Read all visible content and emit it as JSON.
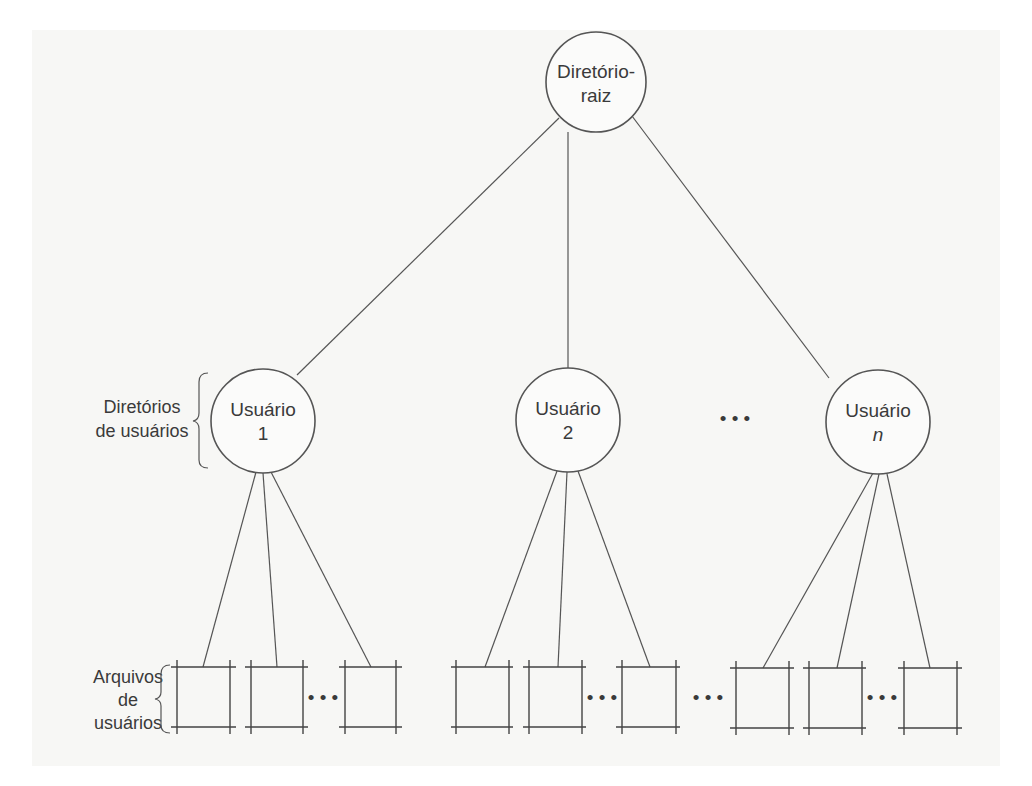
{
  "diagram": {
    "type": "tree",
    "root": {
      "line1": "Diretório-",
      "line2": "raiz"
    },
    "users": [
      {
        "line1": "Usuário",
        "line2": "1",
        "italic": false
      },
      {
        "line1": "Usuário",
        "line2": "2",
        "italic": false
      },
      {
        "line1": "Usuário",
        "line2": "n",
        "italic": true
      }
    ],
    "user_ellipsis": "• • •",
    "file_ellipsis": "• • •",
    "labels": {
      "user_dirs": {
        "line1": "Diretórios",
        "line2": "de usuários"
      },
      "user_files": {
        "line1": "Arquivos",
        "line2": "de",
        "line3": "usuários"
      }
    },
    "file_groups": [
      {
        "user": "Usuário 1",
        "boxes": 3
      },
      {
        "user": "Usuário 2",
        "boxes": 3
      },
      {
        "user": "Usuário n",
        "boxes": 3
      }
    ]
  }
}
